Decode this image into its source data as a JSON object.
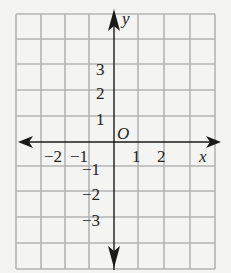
{
  "diagram": {
    "type": "coordinate-grid",
    "grid": {
      "columns": 8,
      "rows": 10,
      "line_color": "#b4b4b4",
      "axis_color": "#1a1a1a"
    },
    "axes": {
      "x_label": "x",
      "y_label": "y",
      "origin_label": "O"
    },
    "x_ticks": [
      "−2",
      "−1",
      "1",
      "2"
    ],
    "y_ticks_positive": [
      "1",
      "2",
      "3"
    ],
    "y_ticks_negative": [
      "−1",
      "−2",
      "−3"
    ]
  }
}
